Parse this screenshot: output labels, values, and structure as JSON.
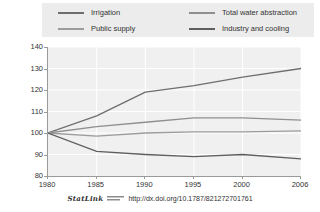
{
  "legend": {
    "items": [
      {
        "label": "Irrigation",
        "color": "#6e6e6e"
      },
      {
        "label": "Total water abstraction",
        "color": "#8f8f8f"
      },
      {
        "label": "Public supply",
        "color": "#9c9c9c"
      },
      {
        "label": "Industry and cooling",
        "color": "#5f5f5f"
      }
    ]
  },
  "footer": {
    "statlink_label": "StatLink",
    "glyph": "statlink-glyph-icon",
    "url": "http://dx.doi.org/10.1787/821272701761"
  },
  "chart_data": {
    "type": "line",
    "title": "",
    "subtitle": "",
    "xlabel": "",
    "ylabel": "",
    "x": [
      1980,
      1985,
      1990,
      1995,
      2000,
      2006
    ],
    "xtick_labels": [
      "1980",
      "1985",
      "1990",
      "1995",
      "2000",
      "2006"
    ],
    "ytick_labels": [
      "80",
      "90",
      "100",
      "110",
      "120",
      "130",
      "140"
    ],
    "yticks": [
      80,
      90,
      100,
      110,
      120,
      130,
      140
    ],
    "ylim": [
      80,
      140
    ],
    "xlim": [
      1980,
      2006
    ],
    "grid": true,
    "legend_position": "top",
    "series": [
      {
        "name": "Irrigation",
        "color": "#6e6e6e",
        "values": [
          100,
          108,
          119,
          122,
          126,
          130
        ]
      },
      {
        "name": "Total water abstraction",
        "color": "#8f8f8f",
        "values": [
          100,
          103,
          105,
          107,
          107,
          106
        ]
      },
      {
        "name": "Public supply",
        "color": "#9c9c9c",
        "values": [
          100,
          98.5,
          100,
          100.5,
          100.5,
          101
        ]
      },
      {
        "name": "Industry and cooling",
        "color": "#5f5f5f",
        "values": [
          100,
          91.5,
          90,
          89,
          90,
          88
        ]
      }
    ]
  }
}
